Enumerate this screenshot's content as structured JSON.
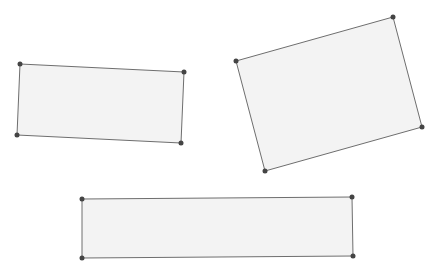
{
  "canvas": {
    "width": 439,
    "height": 271,
    "background": "#ffffff"
  },
  "style": {
    "fill": "#f3f3f3",
    "stroke": "#6e6e6e",
    "vertex": "#444444"
  },
  "shapes": [
    {
      "name": "rectangle-1",
      "points": [
        [
          20,
          64
        ],
        [
          184,
          72
        ],
        [
          181,
          143
        ],
        [
          17,
          135
        ]
      ]
    },
    {
      "name": "rectangle-2",
      "points": [
        [
          236,
          61
        ],
        [
          393,
          17
        ],
        [
          422,
          127
        ],
        [
          265,
          171
        ]
      ]
    },
    {
      "name": "rectangle-3",
      "points": [
        [
          82,
          199
        ],
        [
          352,
          197
        ],
        [
          353,
          256
        ],
        [
          82,
          258
        ]
      ]
    }
  ]
}
